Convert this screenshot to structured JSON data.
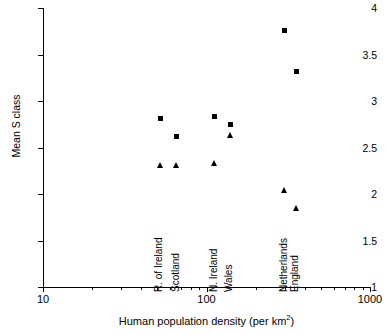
{
  "chart_data": {
    "type": "scatter",
    "title": "",
    "xlabel": "Human population density (per km²)",
    "ylabel": "Mean S class",
    "xscale": "log",
    "xlim": [
      10,
      1000
    ],
    "ylim": [
      1,
      4
    ],
    "xticks": [
      10,
      100,
      1000
    ],
    "xticklabels": [
      "10",
      "100",
      "1000"
    ],
    "yticks": [
      1,
      1.5,
      2,
      2.5,
      3,
      3.5,
      4
    ],
    "yticklabels": [
      "1",
      "1.5",
      "2",
      "2.5",
      "3",
      "3.5",
      "4"
    ],
    "grid": false,
    "legend": "none",
    "series": [
      {
        "name": "square-series",
        "marker": "square",
        "points": [
          {
            "label": "R. of Ireland",
            "x": 52,
            "y": 2.81
          },
          {
            "label": "Scotland",
            "x": 66,
            "y": 2.62
          },
          {
            "label": "N. Ireland",
            "x": 112,
            "y": 2.83
          },
          {
            "label": "Wales",
            "x": 140,
            "y": 2.75
          },
          {
            "label": "Netherlands",
            "x": 300,
            "y": 3.76
          },
          {
            "label": "England",
            "x": 355,
            "y": 3.32
          }
        ]
      },
      {
        "name": "triangle-series",
        "marker": "triangle",
        "points": [
          {
            "label": "R. of Ireland",
            "x": 52,
            "y": 2.31
          },
          {
            "label": "Scotland",
            "x": 66,
            "y": 2.31
          },
          {
            "label": "N. Ireland",
            "x": 112,
            "y": 2.33
          },
          {
            "label": "Wales",
            "x": 140,
            "y": 2.63
          },
          {
            "label": "Netherlands",
            "x": 300,
            "y": 2.04
          },
          {
            "label": "England",
            "x": 355,
            "y": 1.85
          }
        ]
      }
    ],
    "country_labels": [
      {
        "label": "R. of Ireland",
        "x": 52
      },
      {
        "label": "Scotland",
        "x": 66
      },
      {
        "label": "N. Ireland",
        "x": 112
      },
      {
        "label": "Wales",
        "x": 140
      },
      {
        "label": "Netherlands",
        "x": 300
      },
      {
        "label": "England",
        "x": 355
      }
    ],
    "xminorticks": [
      20,
      30,
      40,
      50,
      60,
      70,
      80,
      90,
      200,
      300,
      400,
      500,
      600,
      700,
      800,
      900
    ]
  },
  "axis_title_x_main": "Human population density (per km",
  "axis_title_x_sup": "2",
  "axis_title_x_tail": ")"
}
